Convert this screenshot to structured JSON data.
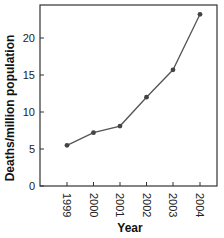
{
  "chart_data": {
    "type": "line",
    "title": "",
    "xlabel": "Year",
    "ylabel": "Deaths/million population",
    "categories": [
      "1999",
      "2000",
      "2001",
      "2002",
      "2003",
      "2004"
    ],
    "series": [
      {
        "name": "Deaths/million population",
        "values": [
          5.5,
          7.2,
          8.1,
          12.0,
          15.7,
          23.2
        ]
      }
    ],
    "ylim": [
      0,
      24.5
    ],
    "yticks": [
      0,
      5,
      10,
      15,
      20
    ],
    "ytick_labels": [
      "0",
      "5",
      "10",
      "15",
      "20"
    ],
    "xtick_labels": [
      "1999",
      "2000",
      "2001",
      "2002",
      "2003",
      "2004"
    ],
    "grid": false,
    "legend": null,
    "colors": {
      "line": "#555555",
      "marker": "#444444",
      "axis": "#333333"
    }
  }
}
